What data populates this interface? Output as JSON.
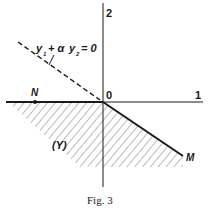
{
  "figure": {
    "caption": "Fig. 3",
    "axes": {
      "y_tick_label": "2",
      "x_tick_label": "1",
      "origin_label": "0"
    },
    "points": {
      "N": "N",
      "M": "M"
    },
    "region_label": "(Y)",
    "dashed_line_label": {
      "y1": "y",
      "sub1": "1",
      "plus_alpha": "+ α",
      "y2": "y",
      "sub2": "2",
      "eq": "= 0"
    },
    "colors": {
      "ink": "#1a1a1a",
      "hatch": "#555555",
      "background": "#ffffff"
    }
  }
}
